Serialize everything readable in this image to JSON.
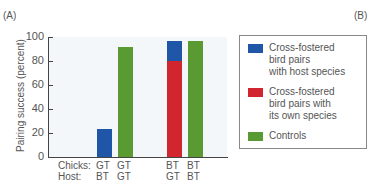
{
  "panels": {
    "left": "(A)",
    "right": "(B)"
  },
  "chart_data": {
    "type": "bar",
    "stacked": true,
    "title": "",
    "ylabel": "Pairing success (percent)",
    "xlabel": "",
    "ylim": [
      0,
      100
    ],
    "yticks": [
      0,
      20,
      40,
      60,
      80,
      100
    ],
    "grid": false,
    "legend_position": "right",
    "row_labels": {
      "chicks": "Chicks:",
      "host": "Host:"
    },
    "categories": [
      {
        "chicks": "GT",
        "host": "BT"
      },
      {
        "chicks": "GT",
        "host": "GT"
      },
      {
        "chicks": "BT",
        "host": "GT"
      },
      {
        "chicks": "BT",
        "host": "BT"
      }
    ],
    "series": [
      {
        "name": "Cross-fostered bird pairs with host species",
        "color": "#1f56a8",
        "values": [
          23,
          0,
          17,
          0
        ]
      },
      {
        "name": "Cross-fostered bird pairs with its own species",
        "color": "#d1252f",
        "values": [
          0,
          0,
          80,
          0
        ]
      },
      {
        "name": "Controls",
        "color": "#5a9a32",
        "values": [
          0,
          92,
          0,
          97
        ]
      }
    ]
  },
  "legend": [
    {
      "label_lines": [
        "Cross-fostered",
        "bird pairs",
        "with host species"
      ],
      "color": "#1f56a8"
    },
    {
      "label_lines": [
        "Cross-fostered",
        "bird pairs with",
        "its own species"
      ],
      "color": "#d1252f"
    },
    {
      "label_lines": [
        "Controls"
      ],
      "color": "#5a9a32"
    }
  ]
}
